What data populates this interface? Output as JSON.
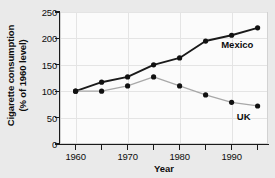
{
  "chart_data": {
    "type": "line",
    "title": "",
    "xlabel": "Year",
    "ylabel_line1": "Cigarette consumption",
    "ylabel_line2": "(% of 1960 level)",
    "x": [
      1960,
      1965,
      1970,
      1975,
      1980,
      1985,
      1990,
      1995
    ],
    "xlim": [
      1957,
      1997
    ],
    "ylim": [
      0,
      250
    ],
    "grid": true,
    "legend_position": "inline-annotations",
    "xticks_major": [
      "1960",
      "1970",
      "1980",
      "1990"
    ],
    "xticks_major_values": [
      1960,
      1970,
      1980,
      1990
    ],
    "xticks_minor_values": [
      1965,
      1975,
      1985,
      1995
    ],
    "yticks": [
      "0",
      "50",
      "100",
      "150",
      "200",
      "250"
    ],
    "ytick_values": [
      0,
      50,
      100,
      150,
      200,
      250
    ],
    "series": [
      {
        "name": "Mexico",
        "color": "#1a1a1a",
        "marker": "circle",
        "values": [
          100,
          117,
          127,
          150,
          163,
          195,
          206,
          220
        ],
        "label_x": 1988,
        "label_y": 188
      },
      {
        "name": "UK",
        "color": "#a8a8a8",
        "marker": "circle",
        "values": [
          100,
          100,
          110,
          127,
          110,
          93,
          79,
          72
        ],
        "label_x": 1991,
        "label_y": 52
      }
    ]
  },
  "figure": {
    "background_color": "#eaeaea",
    "plot_background_color": "#fbfbfb",
    "axis_color": "#1a1a1a",
    "grid_color": "#e4e4e4"
  }
}
